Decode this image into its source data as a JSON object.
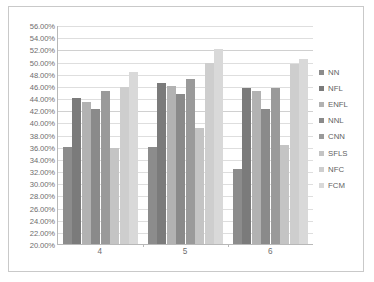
{
  "chart_data": {
    "type": "bar",
    "title": "",
    "subtitle": "",
    "xlabel": "",
    "ylabel": "",
    "categories": [
      "4",
      "5",
      "6"
    ],
    "ylim": [
      20,
      56
    ],
    "ytick_step": 2,
    "ytick_labels": [
      "56.00%",
      "54.00%",
      "52.00%",
      "50.00%",
      "48.00%",
      "46.00%",
      "44.00%",
      "42.00%",
      "40.00%",
      "38.00%",
      "36.00%",
      "34.00%",
      "32.00%",
      "30.00%",
      "28.00%",
      "26.00%",
      "24.00%",
      "22.00%",
      "20.00%"
    ],
    "ytick_values": [
      56,
      54,
      52,
      50,
      48,
      46,
      44,
      42,
      40,
      38,
      36,
      34,
      32,
      30,
      28,
      26,
      24,
      22,
      20
    ],
    "grid": true,
    "legend_position": "right",
    "series": [
      {
        "name": "NN",
        "color": "#8c8c8c",
        "values": [
          36.0,
          36.0,
          32.4
        ]
      },
      {
        "name": "NFL",
        "color": "#7b7b7b",
        "values": [
          44.0,
          46.4,
          45.6
        ]
      },
      {
        "name": "ENFL",
        "color": "#b2b2b2",
        "values": [
          43.4,
          46.0,
          45.2
        ]
      },
      {
        "name": "NNL",
        "color": "#8a8a8a",
        "values": [
          42.2,
          44.6,
          42.2
        ]
      },
      {
        "name": "CNN",
        "color": "#9a9a9a",
        "values": [
          45.2,
          47.2,
          45.6
        ]
      },
      {
        "name": "SFLS",
        "color": "#c4c4c4",
        "values": [
          35.8,
          39.0,
          36.2
        ]
      },
      {
        "name": "NFC",
        "color": "#cecece",
        "values": [
          45.8,
          49.8,
          49.6
        ]
      },
      {
        "name": "FCM",
        "color": "#d9d9d9",
        "values": [
          48.2,
          52.0,
          50.4
        ]
      }
    ]
  },
  "legend": {
    "items": [
      {
        "label": "NN"
      },
      {
        "label": "NFL"
      },
      {
        "label": "ENFL"
      },
      {
        "label": "NNL"
      },
      {
        "label": "CNN"
      },
      {
        "label": "SFLS"
      },
      {
        "label": "NFC"
      },
      {
        "label": "FCM"
      }
    ]
  },
  "colors": {
    "frame_border": "#c9c9c9",
    "axis_line": "#b8b8b8",
    "gridline": "#dedede",
    "tick_text": "#6d6d6d",
    "legend_text": "#5f5f5f",
    "plot_background": "#ffffff"
  }
}
